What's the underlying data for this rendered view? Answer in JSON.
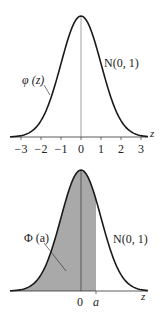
{
  "chart_data": [
    {
      "type": "line",
      "title": "",
      "xlabel": "z",
      "ylabel": "",
      "x_ticks": [
        "−3",
        "−2",
        "−1",
        "0",
        "1",
        "2",
        "3"
      ],
      "xlim": [
        -3.5,
        3.4
      ],
      "series": [
        {
          "name": "φ (z)",
          "function": "standard normal pdf"
        }
      ],
      "annotations": {
        "curve_label": "φ (z)",
        "dist_label": "N(0, 1)"
      },
      "grid": false
    },
    {
      "type": "area",
      "title": "",
      "xlabel": "z",
      "x_ticks": [
        "0",
        "a"
      ],
      "shaded_region": {
        "from": "-inf",
        "to": "a",
        "a_value": 0.8
      },
      "annotations": {
        "area_label": "Φ (a)",
        "dist_label": "N(0, 1)"
      },
      "grid": false
    }
  ],
  "top": {
    "curve_label": "φ (z)",
    "dist_label": "N(0, 1)",
    "axis_label": "z",
    "ticks": [
      "−3",
      "−2",
      "−1",
      "0",
      "1",
      "2",
      "3"
    ]
  },
  "bottom": {
    "area_label": "Φ (a)",
    "dist_label": "N(0, 1)",
    "axis_label": "z",
    "tick_zero": "0",
    "tick_a": "a"
  },
  "colors": {
    "curve": "#1a1a1a",
    "shade": "#a9a9a9",
    "axis": "#333333"
  }
}
